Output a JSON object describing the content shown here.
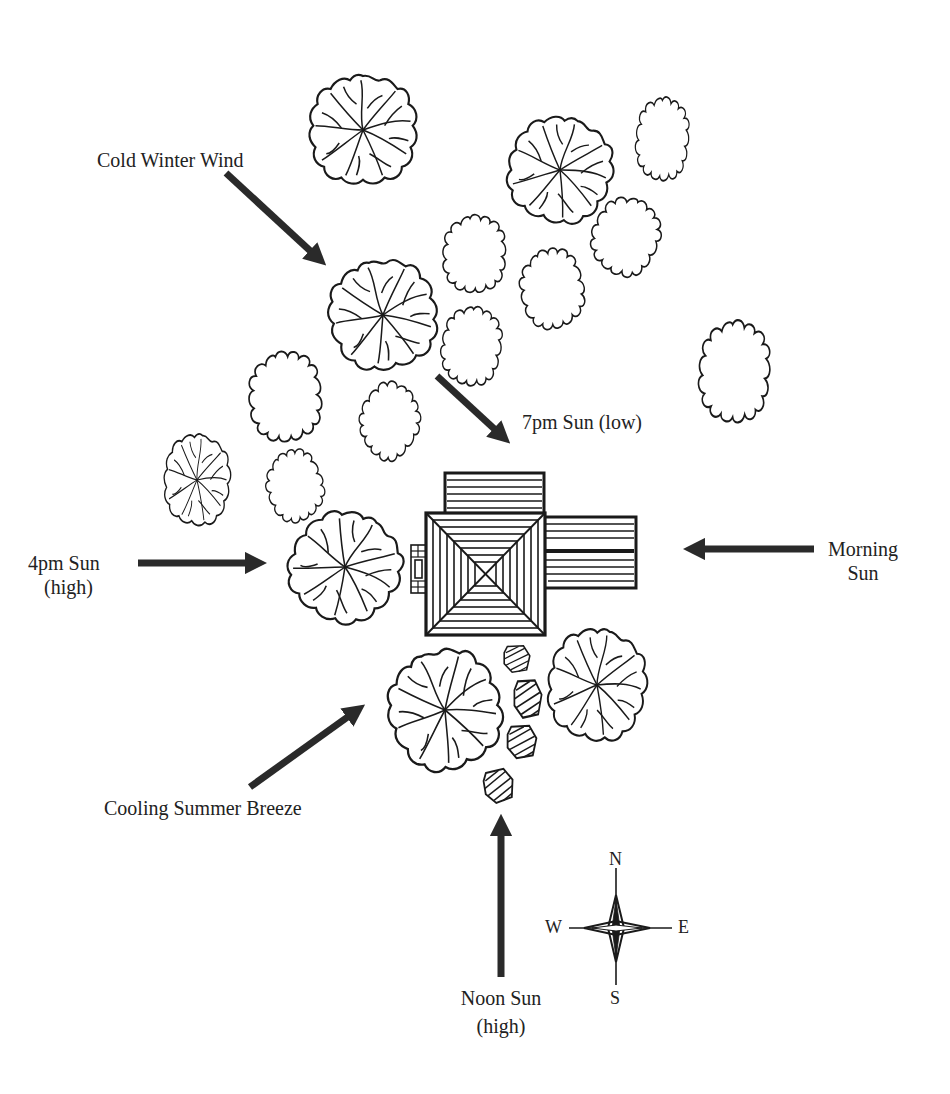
{
  "diagram": {
    "labels": {
      "cold_winter_wind": "Cold Winter Wind",
      "sun_7pm": "7pm Sun (low)",
      "sun_4pm_line1": "4pm Sun",
      "sun_4pm_line2": "(high)",
      "morning_sun_line1": "Morning",
      "morning_sun_line2": "Sun",
      "cooling_breeze": "Cooling Summer Breeze",
      "noon_sun_line1": "Noon Sun",
      "noon_sun_line2": "(high)"
    },
    "compass": {
      "north": "N",
      "south": "S",
      "east": "E",
      "west": "W"
    },
    "colors": {
      "ink": "#1a1a1a",
      "arrow": "#2a2a2a",
      "background": "#ffffff"
    },
    "trees": {
      "deciduous_leafy": [
        {
          "cx": 363,
          "cy": 130,
          "r": 55
        },
        {
          "cx": 560,
          "cy": 170,
          "r": 52
        },
        {
          "cx": 383,
          "cy": 315,
          "r": 55
        },
        {
          "cx": 197,
          "cy": 480,
          "r": 34
        },
        {
          "cx": 345,
          "cy": 567,
          "r": 55
        },
        {
          "cx": 445,
          "cy": 710,
          "r": 58
        },
        {
          "cx": 597,
          "cy": 685,
          "r": 50
        }
      ],
      "shrub_outline": [
        {
          "cx": 662,
          "cy": 140,
          "rx": 27,
          "ry": 40
        },
        {
          "cx": 474,
          "cy": 255,
          "rx": 33,
          "ry": 38
        },
        {
          "cx": 625,
          "cy": 237,
          "rx": 34,
          "ry": 38
        },
        {
          "cx": 552,
          "cy": 290,
          "rx": 33,
          "ry": 38
        },
        {
          "cx": 471,
          "cy": 347,
          "rx": 31,
          "ry": 38
        },
        {
          "cx": 285,
          "cy": 398,
          "rx": 38,
          "ry": 43
        },
        {
          "cx": 389,
          "cy": 421,
          "rx": 29,
          "ry": 38
        },
        {
          "cx": 295,
          "cy": 487,
          "rx": 29,
          "ry": 34
        },
        {
          "cx": 734,
          "cy": 373,
          "rx": 37,
          "ry": 48
        }
      ]
    },
    "stepping_stones": [
      {
        "cx": 517,
        "cy": 659
      },
      {
        "cx": 528,
        "cy": 699
      },
      {
        "cx": 522,
        "cy": 742
      },
      {
        "cx": 499,
        "cy": 786
      }
    ]
  }
}
